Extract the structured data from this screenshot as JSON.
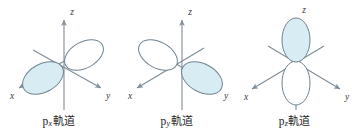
{
  "figure": {
    "name": "p-orbital-shapes-figure",
    "background_color": "#ffffff",
    "axis_color": "#7d8d99",
    "lobe_outline_color": "#6f8391",
    "lobe_fill_color": "#d8ecf4",
    "lobe_empty_fill_color": "#ffffff",
    "text_color": "#1b1b1b"
  },
  "panels": [
    {
      "id": "px",
      "caption_symbol": "p",
      "caption_subscript": "x",
      "caption_suffix": "軌道",
      "caption_full": "pₓ軌道",
      "orbital_axis": "x",
      "filled_lobe_direction": "lower-left",
      "empty_lobe_direction": "upper-right",
      "axes": [
        {
          "label": "z",
          "direction": "up",
          "arrow": true
        },
        {
          "label": "x",
          "direction": "lower-left",
          "arrow": true
        },
        {
          "label": "y",
          "direction": "lower-right",
          "arrow": true
        }
      ]
    },
    {
      "id": "py",
      "caption_symbol": "p",
      "caption_subscript": "y",
      "caption_suffix": "軌道",
      "caption_full": "pᵧ軌道",
      "orbital_axis": "y",
      "filled_lobe_direction": "lower-right",
      "empty_lobe_direction": "upper-left",
      "axes": [
        {
          "label": "z",
          "direction": "up",
          "arrow": true
        },
        {
          "label": "x",
          "direction": "lower-left",
          "arrow": true
        },
        {
          "label": "y",
          "direction": "lower-right",
          "arrow": true
        }
      ]
    },
    {
      "id": "pz",
      "caption_symbol": "p",
      "caption_subscript": "z",
      "caption_suffix": "軌道",
      "caption_full": "pₖ軌道",
      "orbital_axis": "z",
      "filled_lobe_direction": "up",
      "empty_lobe_direction": "down",
      "axes": [
        {
          "label": "z",
          "direction": "up",
          "arrow": true
        },
        {
          "label": "x",
          "direction": "lower-left",
          "arrow": true
        },
        {
          "label": "y",
          "direction": "lower-right",
          "arrow": true
        }
      ]
    }
  ]
}
